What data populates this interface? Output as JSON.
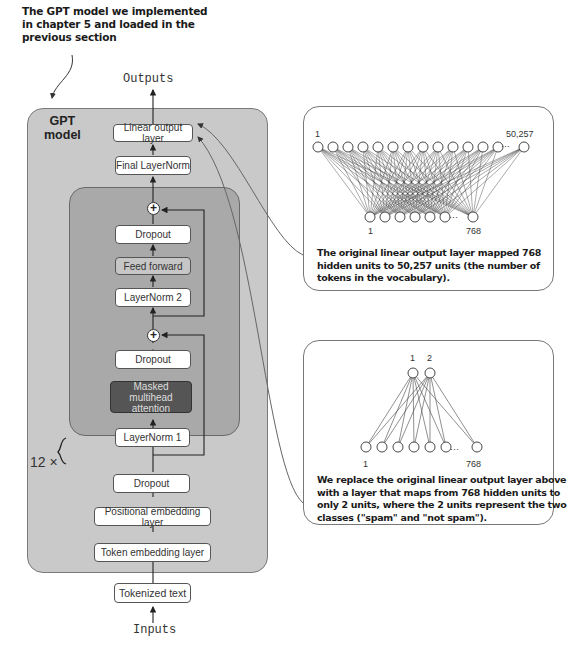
{
  "annotation_top": {
    "lines": [
      "The GPT model we implemented",
      "in chapter 5 and loaded in the",
      "previous section"
    ]
  },
  "io": {
    "outputs": "Outputs",
    "inputs": "Inputs"
  },
  "gpt_model": {
    "label_line1": "GPT",
    "label_line2": "model",
    "repeat_label": "12 ×",
    "layers": {
      "linear_output": "Linear output layer",
      "final_layernorm": "Final LayerNorm",
      "dropout_top": "Dropout",
      "feed_forward": "Feed forward",
      "layernorm2": "LayerNorm 2",
      "dropout_mid": "Dropout",
      "masked_attention_line1": "Masked multihead",
      "masked_attention_line2": "attention",
      "layernorm1": "LayerNorm 1",
      "dropout_bottom": "Dropout",
      "positional_embedding": "Positional embedding layer",
      "token_embedding": "Token embedding layer"
    },
    "tokenized_text": "Tokenized text",
    "plus_symbol": "+"
  },
  "panel_original": {
    "top_first_label": "1",
    "top_last_label": "50,257",
    "bottom_first_label": "1",
    "bottom_last_label": "768",
    "ellipsis": "···",
    "top_nodes": 14,
    "bottom_nodes": 7,
    "caption_lines": [
      "The original linear output layer mapped 768",
      "hidden units to 50,257 units (the number of",
      "tokens in the vocabulary)."
    ]
  },
  "panel_replacement": {
    "top_first_label": "1",
    "top_second_label": "2",
    "bottom_first_label": "1",
    "bottom_last_label": "768",
    "ellipsis": "···",
    "caption_lines": [
      "We replace the original linear output layer above",
      "with a layer that maps from 768 hidden units to",
      "only 2 units, where the 2 units represent the two",
      "classes (\"spam\" and \"not spam\")."
    ]
  },
  "colors": {
    "outer_box": "#c9c9c9",
    "inner_box": "#a9a9a9",
    "attention_box": "#555555",
    "feed_forward_box": "#c6c6c6"
  }
}
